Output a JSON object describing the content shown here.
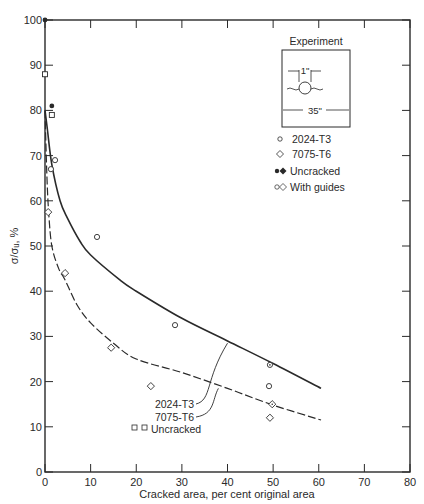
{
  "chart_data": {
    "type": "scatter",
    "title": "",
    "xlabel": "Cracked area, per cent original area",
    "ylabel": "σ/σᵤ, %",
    "xlim": [
      0,
      80
    ],
    "ylim": [
      0,
      100
    ],
    "xticks": [
      0,
      10,
      20,
      30,
      40,
      50,
      60,
      70,
      80
    ],
    "yticks": [
      0,
      10,
      20,
      30,
      40,
      50,
      60,
      70,
      80,
      90,
      100
    ],
    "grid": false,
    "legend_position": "upper right (inside plot)",
    "inset": {
      "title": "Experiment",
      "hole_label": "1\"",
      "width_label": "35\""
    },
    "legend": [
      {
        "marker": "open-circle",
        "label": "2024-T3"
      },
      {
        "marker": "open-diamond",
        "label": "7075-T6"
      },
      {
        "marker": "filled-circle-diamond",
        "label": "Uncracked"
      },
      {
        "marker": "dotted-circle-diamond",
        "label": "With guides"
      }
    ],
    "annotations": [
      {
        "text": "2024-T3",
        "arrow_to": [
          40,
          28.5
        ]
      },
      {
        "text": "7075-T6",
        "arrow_to": [
          38,
          18.5
        ]
      },
      {
        "text": "Uncracked",
        "marker": "open-square-star"
      }
    ],
    "series": [
      {
        "name": "2024-T3 data",
        "marker": "open-circle",
        "points": [
          [
            2.2,
            69
          ],
          [
            1.3,
            67
          ],
          [
            11.4,
            52
          ],
          [
            28.5,
            32.5
          ],
          [
            49.1,
            19
          ]
        ]
      },
      {
        "name": "7075-T6 data",
        "marker": "open-diamond",
        "points": [
          [
            0.7,
            57.5
          ],
          [
            4.4,
            44
          ],
          [
            14.5,
            27.5
          ],
          [
            23.2,
            19
          ],
          [
            49.3,
            12
          ]
        ]
      },
      {
        "name": "2024-T3 with guides",
        "marker": "dotted-circle",
        "points": [
          [
            49.3,
            23.7
          ]
        ]
      },
      {
        "name": "7075-T6 with guides",
        "marker": "dotted-diamond",
        "points": [
          [
            49.8,
            15
          ]
        ]
      },
      {
        "name": "Uncracked (filled)",
        "marker": "filled",
        "points": [
          [
            0,
            100
          ],
          [
            1.5,
            81
          ]
        ]
      },
      {
        "name": "Uncracked (open)",
        "marker": "open-square-star",
        "points": [
          [
            0,
            88
          ],
          [
            1.5,
            79
          ]
        ]
      },
      {
        "name": "2024-T3 curve",
        "style": "solid",
        "points": [
          [
            0,
            80
          ],
          [
            0.5,
            76
          ],
          [
            1.5,
            68
          ],
          [
            3.3,
            60
          ],
          [
            5,
            56
          ],
          [
            7.7,
            51
          ],
          [
            10,
            48
          ],
          [
            16.4,
            42.5
          ],
          [
            20,
            40
          ],
          [
            30,
            34
          ],
          [
            40,
            29
          ],
          [
            50,
            24
          ],
          [
            60.5,
            18.5
          ]
        ]
      },
      {
        "name": "7075-T6 curve",
        "style": "dashed",
        "points": [
          [
            0,
            80
          ],
          [
            0.4,
            66
          ],
          [
            0.8,
            57.5
          ],
          [
            1.5,
            50
          ],
          [
            3,
            45
          ],
          [
            4.4,
            42.5
          ],
          [
            7,
            37
          ],
          [
            10,
            33
          ],
          [
            15,
            28.5
          ],
          [
            20,
            25
          ],
          [
            30,
            22
          ],
          [
            40,
            18.5
          ],
          [
            50,
            14.8
          ],
          [
            60.5,
            11.5
          ]
        ]
      }
    ]
  }
}
